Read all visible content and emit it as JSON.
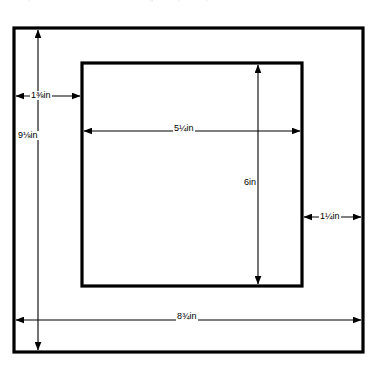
{
  "figure": {
    "type": "technical-dimension-diagram",
    "units": "in"
  },
  "shapes": {
    "outer_rect": {
      "name": "outer-board",
      "x": 14,
      "y": 28,
      "width": 349,
      "height": 324
    },
    "inner_rect": {
      "name": "inner-opening",
      "x": 82,
      "y": 63,
      "width": 220,
      "height": 223
    }
  },
  "dimensions": [
    {
      "id": "left-margin",
      "label": "1⅜in",
      "orientation": "horizontal",
      "value": 1.375,
      "label_x": 30,
      "label_y": 91
    },
    {
      "id": "outer-height",
      "label": "9⅛in",
      "orientation": "vertical",
      "value": 9.125,
      "label_x": 19,
      "label_y": 131
    },
    {
      "id": "opening-width",
      "label": "5¼in",
      "orientation": "horizontal",
      "value": 5.25,
      "label_x": 173,
      "label_y": 124
    },
    {
      "id": "opening-height",
      "label": "6in",
      "orientation": "vertical",
      "value": 6,
      "label_x": 243,
      "label_y": 178
    },
    {
      "id": "right-margin",
      "label": "1¼in",
      "orientation": "horizontal",
      "value": 1.25,
      "label_x": 319,
      "label_y": 212
    },
    {
      "id": "outer-width",
      "label": "8¾in",
      "orientation": "horizontal",
      "value": 8.75,
      "label_x": 176,
      "label_y": 312
    }
  ],
  "colors": {
    "stroke": "#000000",
    "background": "#ffffff",
    "faint": "#9a9a9a"
  },
  "artifacts": {
    "top_edge_marks": ". . . . ."
  }
}
